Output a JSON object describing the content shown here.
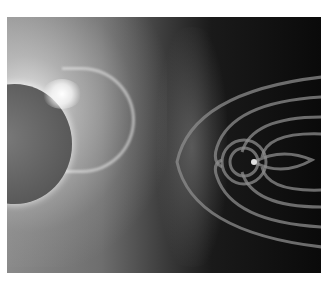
{
  "image": {
    "description": "Grayscale illustration of a solar coronal mass ejection traveling from the Sun toward Earth's magnetosphere",
    "subjects": [
      "sun",
      "coronal-mass-ejection",
      "earth",
      "magnetosphere-field-lines",
      "stars"
    ],
    "colors": {
      "background": "#ffffff",
      "space": "#0a0a0a",
      "sun": "#5e5e5e",
      "glow": "#ffffff"
    }
  }
}
